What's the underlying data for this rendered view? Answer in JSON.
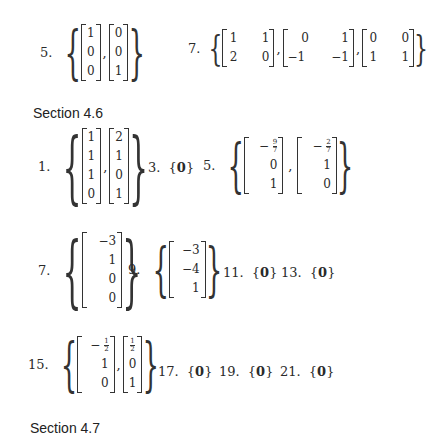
{
  "top_answers": [
    {
      "label": "5.",
      "vectors": [
        [
          "1",
          "0",
          "0"
        ],
        [
          "0",
          "0",
          "1"
        ]
      ]
    },
    {
      "label": "7.",
      "matrices": [
        [
          [
            "1",
            "1"
          ],
          [
            "2",
            "0"
          ]
        ],
        [
          [
            "0",
            "1"
          ],
          [
            "−1",
            "−1"
          ]
        ],
        [
          [
            "0",
            "0"
          ],
          [
            "1",
            "1"
          ]
        ]
      ]
    }
  ],
  "section_46": {
    "title": "Section 4.6",
    "answers": [
      {
        "label": "1.",
        "vectors": [
          [
            "1",
            "1",
            "1",
            "0"
          ],
          [
            "2",
            "1",
            "0",
            "1"
          ]
        ]
      },
      {
        "label": "3.",
        "text": "{0}"
      },
      {
        "label": "5.",
        "vectors": [
          [
            "−9/7",
            "0",
            "1"
          ],
          [
            "−2/7",
            "1",
            "0"
          ]
        ]
      },
      {
        "label": "7.",
        "vectors": [
          [
            "−3",
            "1",
            "0",
            "0"
          ]
        ]
      },
      {
        "label": "9.",
        "vectors": [
          [
            "−3",
            "−4",
            "1"
          ]
        ]
      },
      {
        "label": "11.",
        "text": "{0}"
      },
      {
        "label": "13.",
        "text": "{0}"
      },
      {
        "label": "15.",
        "vectors": [
          [
            "−1/2",
            "1",
            "0"
          ],
          [
            "1/2",
            "0",
            "1"
          ]
        ]
      },
      {
        "label": "17.",
        "text": "{0}"
      },
      {
        "label": "19.",
        "text": "{0}"
      },
      {
        "label": "21.",
        "text": "{0}"
      }
    ]
  },
  "section_47": {
    "title": "Section 4.7"
  },
  "glyphs": {
    "lbrace": "{",
    "rbrace": "}",
    "comma": ",",
    "lset": "{",
    "rset": "}",
    "zero": "0",
    "minus": "−"
  },
  "fractions": {
    "nine_sevenths": {
      "sign": "−",
      "num": "9",
      "den": "7"
    },
    "two_sevenths": {
      "sign": "−",
      "num": "2",
      "den": "7"
    },
    "neg_half": {
      "sign": "−",
      "num": "1",
      "den": "2"
    },
    "half": {
      "num": "1",
      "den": "2"
    }
  }
}
